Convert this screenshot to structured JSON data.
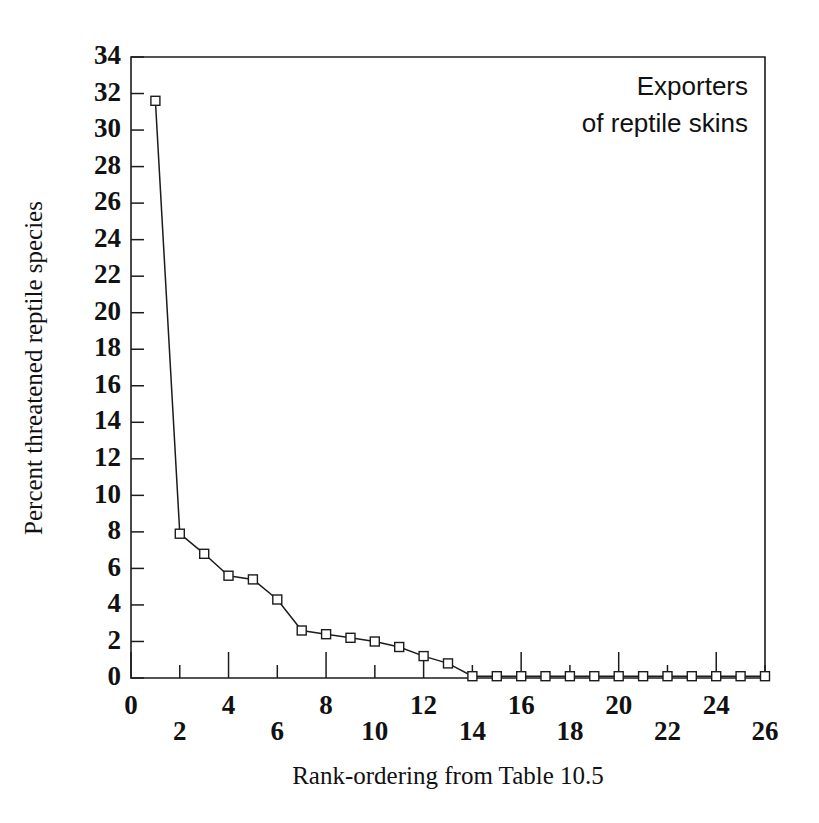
{
  "chart_data": {
    "type": "line",
    "title": "",
    "annotation": [
      "Exporters",
      "of reptile skins"
    ],
    "xlabel": "Rank-ordering from Table 10.5",
    "ylabel": "Percent threatened reptile species",
    "xlim": [
      0,
      26
    ],
    "ylim": [
      0,
      34
    ],
    "grid": false,
    "legend": "none",
    "marker": "open-square",
    "x": [
      1,
      2,
      3,
      4,
      5,
      6,
      7,
      8,
      9,
      10,
      11,
      12,
      13,
      14,
      15,
      16,
      17,
      18,
      19,
      20,
      21,
      22,
      23,
      24,
      25,
      26
    ],
    "values": [
      31.6,
      7.9,
      6.8,
      5.6,
      5.4,
      4.3,
      2.6,
      2.4,
      2.2,
      2.0,
      1.7,
      1.2,
      0.8,
      0.1,
      0.1,
      0.1,
      0.1,
      0.1,
      0.1,
      0.1,
      0.1,
      0.1,
      0.1,
      0.1,
      0.1,
      0.1
    ],
    "xticks": [
      0,
      2,
      4,
      6,
      8,
      10,
      12,
      14,
      16,
      18,
      20,
      22,
      24,
      26
    ],
    "xtick_labels": [
      "0",
      "2",
      "4",
      "6",
      "8",
      "10",
      "12",
      "14",
      "16",
      "18",
      "20",
      "22",
      "24",
      "26"
    ],
    "yticks": [
      0,
      2,
      4,
      6,
      8,
      10,
      12,
      14,
      16,
      18,
      20,
      22,
      24,
      26,
      28,
      30,
      32,
      34
    ],
    "ytick_labels": [
      "0",
      "2",
      "4",
      "6",
      "8",
      "10",
      "12",
      "14",
      "16",
      "18",
      "20",
      "22",
      "24",
      "26",
      "28",
      "30",
      "32",
      "34"
    ],
    "colors": {
      "line": "#1c1c1c",
      "marker_face": "#ffffff",
      "marker_edge": "#1c1c1c",
      "axis": "#1c1c1c",
      "background": "#ffffff",
      "text": "#111111"
    }
  }
}
